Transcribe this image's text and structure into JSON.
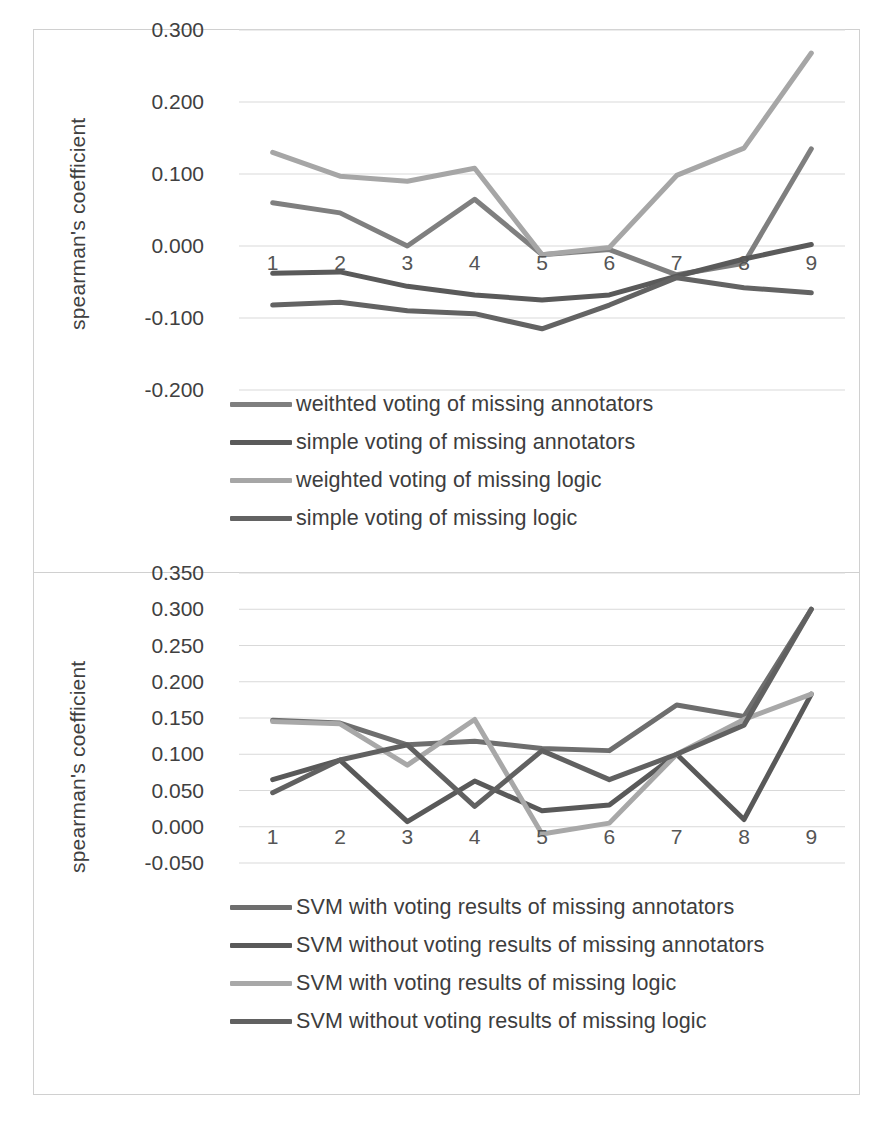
{
  "figure": {
    "panels": [
      {
        "id": "voting-panel",
        "ylabel": "spearman's coefficient",
        "yticks": [
          "0.300",
          "0.200",
          "0.100",
          "0.000",
          "-0.100",
          "-0.200"
        ],
        "xticks": [
          "1",
          "2",
          "3",
          "4",
          "5",
          "6",
          "7",
          "8",
          "9"
        ],
        "legend": [
          {
            "label": "weithted voting of missing annotators",
            "color": "#7f7f7f"
          },
          {
            "label": "simple voting of missing annotators",
            "color": "#5a5a5a"
          },
          {
            "label": "weighted voting of missing logic",
            "color": "#a6a6a6"
          },
          {
            "label": "simple voting of missing logic",
            "color": "#636363"
          }
        ]
      },
      {
        "id": "svm-panel",
        "ylabel": "spearman's coefficient",
        "yticks": [
          "0.350",
          "0.300",
          "0.250",
          "0.200",
          "0.150",
          "0.100",
          "0.050",
          "0.000",
          "-0.050"
        ],
        "xticks": [
          "1",
          "2",
          "3",
          "4",
          "5",
          "6",
          "7",
          "8",
          "9"
        ],
        "legend": [
          {
            "label": "SVM with voting results of missing annotators",
            "color": "#6e6e6e"
          },
          {
            "label": "SVM without voting results of missing annotators",
            "color": "#595959"
          },
          {
            "label": "SVM with voting results of missing logic",
            "color": "#a8a8a8"
          },
          {
            "label": "SVM without voting results of missing logic",
            "color": "#616161"
          }
        ]
      }
    ]
  },
  "chart_data": [
    {
      "type": "line",
      "id": "voting-comparison",
      "title": "",
      "xlabel": "",
      "ylabel": "spearman's coefficient",
      "x": [
        1,
        2,
        3,
        4,
        5,
        6,
        7,
        8,
        9
      ],
      "categories": [
        "1",
        "2",
        "3",
        "4",
        "5",
        "6",
        "7",
        "8",
        "9"
      ],
      "ylim": [
        -0.2,
        0.3
      ],
      "ytick_values": [
        0.3,
        0.2,
        0.1,
        0.0,
        -0.1,
        -0.2
      ],
      "grid": true,
      "legend_position": "below",
      "series": [
        {
          "name": "weithted voting of missing annotators",
          "color": "#7f7f7f",
          "values": [
            0.06,
            0.046,
            0.0,
            0.065,
            -0.012,
            -0.005,
            -0.04,
            -0.024,
            0.135
          ]
        },
        {
          "name": "simple voting of missing annotators",
          "color": "#5a5a5a",
          "values": [
            -0.038,
            -0.036,
            -0.056,
            -0.068,
            -0.075,
            -0.068,
            -0.042,
            -0.018,
            0.002
          ]
        },
        {
          "name": "weighted voting of missing logic",
          "color": "#a6a6a6",
          "values": [
            0.13,
            0.097,
            0.09,
            0.108,
            -0.012,
            -0.002,
            0.098,
            0.136,
            0.268
          ]
        },
        {
          "name": "simple voting of missing logic",
          "color": "#636363",
          "values": [
            -0.082,
            -0.078,
            -0.09,
            -0.094,
            -0.115,
            -0.082,
            -0.044,
            -0.058,
            -0.065
          ]
        }
      ]
    },
    {
      "type": "line",
      "id": "svm-comparison",
      "title": "",
      "xlabel": "",
      "ylabel": "spearman's coefficient",
      "x": [
        1,
        2,
        3,
        4,
        5,
        6,
        7,
        8,
        9
      ],
      "categories": [
        "1",
        "2",
        "3",
        "4",
        "5",
        "6",
        "7",
        "8",
        "9"
      ],
      "ylim": [
        -0.05,
        0.35
      ],
      "ytick_values": [
        0.35,
        0.3,
        0.25,
        0.2,
        0.15,
        0.1,
        0.05,
        0.0,
        -0.05
      ],
      "grid": true,
      "legend_position": "below",
      "series": [
        {
          "name": "SVM with voting results of missing annotators",
          "color": "#6e6e6e",
          "values": [
            0.147,
            0.143,
            0.113,
            0.118,
            0.108,
            0.105,
            0.168,
            0.152,
            0.3
          ]
        },
        {
          "name": "SVM without voting results of missing annotators",
          "color": "#595959",
          "values": [
            0.065,
            0.092,
            0.007,
            0.063,
            0.022,
            0.03,
            0.1,
            0.01,
            0.183
          ]
        },
        {
          "name": "SVM with voting results of missing logic",
          "color": "#a8a8a8",
          "values": [
            0.145,
            0.142,
            0.085,
            0.148,
            -0.01,
            0.005,
            0.1,
            0.148,
            0.183
          ]
        },
        {
          "name": "SVM without voting results of missing logic",
          "color": "#616161",
          "values": [
            0.047,
            0.092,
            0.113,
            0.028,
            0.105,
            0.065,
            0.1,
            0.14,
            0.3
          ]
        }
      ]
    }
  ]
}
